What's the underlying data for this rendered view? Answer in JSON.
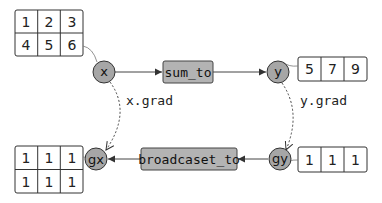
{
  "diagram": {
    "colors": {
      "node_fill": "#a6a6a6",
      "node_stroke": "#333333",
      "func_fill": "#b3b3b3",
      "func_stroke": "#444444",
      "line": "#444444",
      "table_stroke": "#333333"
    },
    "nodes": {
      "x": "x",
      "y": "y",
      "gx": "gx",
      "gy": "gy"
    },
    "functions": {
      "forward": "sum_to",
      "backward": "broadcaset_to"
    },
    "grad_labels": {
      "x_grad": "x.grad",
      "y_grad": "y.grad"
    },
    "tables": {
      "x_values": [
        [
          "1",
          "2",
          "3"
        ],
        [
          "4",
          "5",
          "6"
        ]
      ],
      "y_values": [
        [
          "5",
          "7",
          "9"
        ]
      ],
      "gy_values": [
        [
          "1",
          "1",
          "1"
        ]
      ],
      "gx_values": [
        [
          "1",
          "1",
          "1"
        ],
        [
          "1",
          "1",
          "1"
        ]
      ]
    }
  }
}
